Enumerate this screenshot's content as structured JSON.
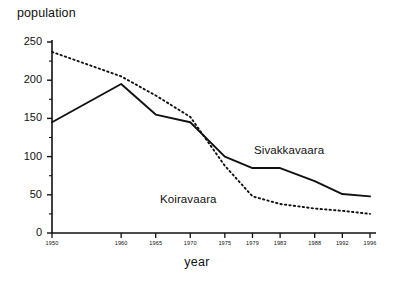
{
  "chart_data": {
    "type": "line",
    "title": "",
    "xlabel": "year",
    "ylabel": "population",
    "xlim": [
      1950,
      1996
    ],
    "ylim": [
      0,
      250
    ],
    "grid": false,
    "legend_position": "inline-annotations",
    "x": [
      1950,
      1960,
      1965,
      1970,
      1975,
      1979,
      1983,
      1988,
      1992,
      1996
    ],
    "xtick_labels": [
      "1950",
      "1960",
      "1965",
      "1970",
      "1975",
      "1979",
      "1983",
      "1988",
      "1992",
      "1996"
    ],
    "ytick_labels": [
      "0",
      "50",
      "100",
      "150",
      "200",
      "250"
    ],
    "ytick_values": [
      0,
      50,
      100,
      150,
      200,
      250
    ],
    "series": [
      {
        "name": "Sivakkavaara",
        "style": "solid",
        "color": "#111111",
        "x": [
          1950,
          1960,
          1965,
          1970,
          1975,
          1979,
          1983,
          1988,
          1992,
          1996
        ],
        "values": [
          145,
          195,
          155,
          145,
          100,
          85,
          85,
          68,
          51,
          48
        ],
        "annotation_label": "Sivakkavaara"
      },
      {
        "name": "Koiravaara",
        "style": "dotted",
        "color": "#111111",
        "x": [
          1950,
          1960,
          1965,
          1970,
          1975,
          1979,
          1983,
          1988,
          1992,
          1996
        ],
        "values": [
          237,
          205,
          180,
          152,
          88,
          48,
          38,
          32,
          29,
          25
        ],
        "annotation_label": "Koiravaara"
      }
    ]
  },
  "axes": {
    "ylabel_text": "population",
    "xlabel_text": "year"
  }
}
